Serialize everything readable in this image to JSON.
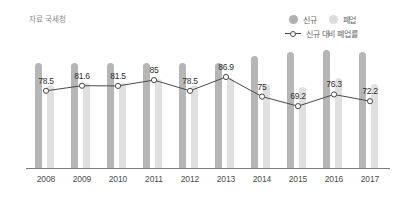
{
  "source_note": "자료 국세청",
  "legend": {
    "items": [
      {
        "label": "신규",
        "icon": "legend-dot-icon",
        "color": "#b0b0b0"
      },
      {
        "label": "폐업",
        "icon": "legend-dot-icon",
        "color": "#dcdcdc"
      }
    ],
    "line_item": {
      "label": "신규 대비 폐업률",
      "icon": "legend-line-marker-icon",
      "color": "#4a4a4a"
    }
  },
  "chart_data": {
    "type": "bar",
    "title": "",
    "subtitle": "",
    "xlabel": "",
    "ylabel": "",
    "grid": false,
    "legend_position": "top-right",
    "categories": [
      "2008",
      "2009",
      "2010",
      "2011",
      "2012",
      "2013",
      "2014",
      "2015",
      "2016",
      "2017"
    ],
    "series": [
      {
        "name": "신규",
        "type": "bar",
        "color": "#b6b6b6",
        "values": [
          86,
          86,
          86,
          86,
          86,
          86,
          92,
          95,
          97,
          95
        ]
      },
      {
        "name": "폐업",
        "type": "bar",
        "color": "#e0e0e0",
        "values": [
          68,
          70,
          70,
          73,
          68,
          74,
          69,
          66,
          74,
          69
        ]
      },
      {
        "name": "신규 대비 폐업률",
        "type": "line",
        "color": "#4a4a4a",
        "values": [
          78.5,
          81.6,
          81.5,
          85,
          78.5,
          86.9,
          75,
          69.2,
          76.3,
          72.2
        ],
        "labels": [
          "78.5",
          "81.6",
          "81.5",
          "85",
          "78.5",
          "86.9",
          "75",
          "69.2",
          "76.3",
          "72.2"
        ]
      }
    ],
    "ylim": [
      0,
      100
    ]
  }
}
